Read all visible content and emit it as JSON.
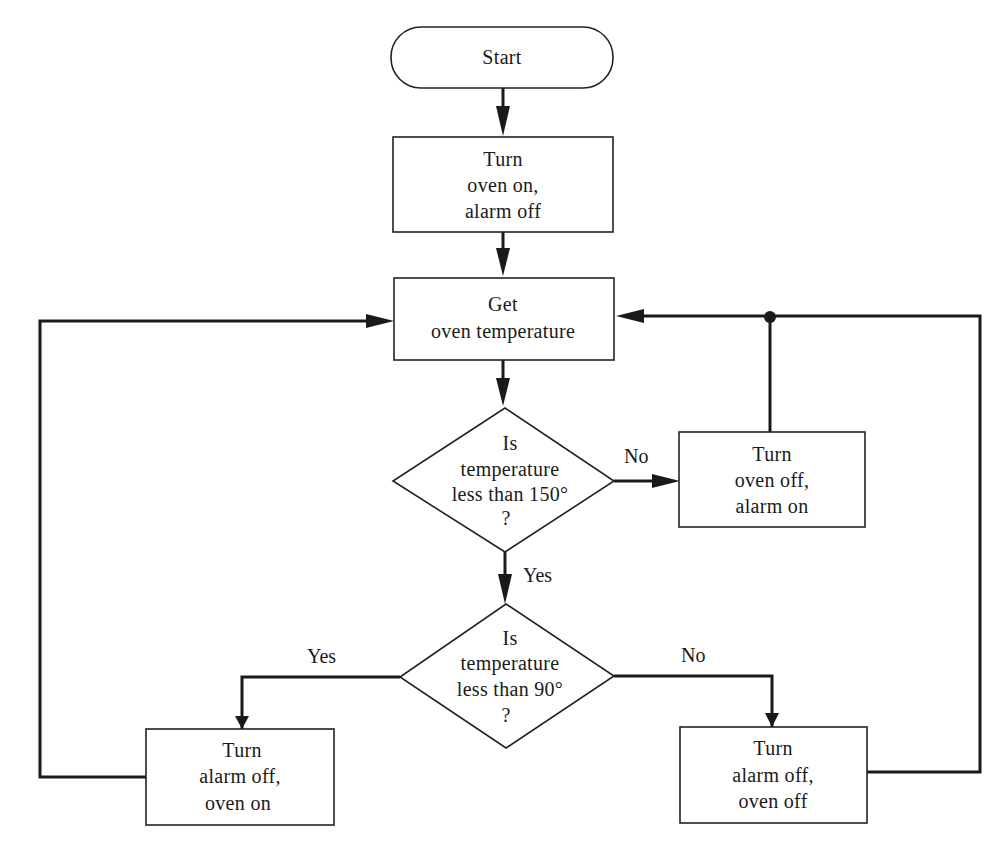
{
  "diagram": {
    "type": "flowchart",
    "nodes": {
      "start": {
        "kind": "terminator",
        "lines": [
          "Start"
        ]
      },
      "init": {
        "kind": "process",
        "lines": [
          "Turn",
          "oven on,",
          "alarm off"
        ]
      },
      "get_temp": {
        "kind": "process",
        "lines": [
          "Get",
          "oven temperature"
        ]
      },
      "check150": {
        "kind": "decision",
        "lines": [
          "Is",
          "temperature",
          "less than 150°",
          "?"
        ]
      },
      "overheat": {
        "kind": "process",
        "lines": [
          "Turn",
          "oven off,",
          "alarm on"
        ]
      },
      "check90": {
        "kind": "decision",
        "lines": [
          "Is",
          "temperature",
          "less than 90°",
          "?"
        ]
      },
      "heat": {
        "kind": "process",
        "lines": [
          "Turn",
          "alarm off,",
          "oven on"
        ]
      },
      "hold": {
        "kind": "process",
        "lines": [
          "Turn",
          "alarm off,",
          "oven off"
        ]
      }
    },
    "edge_labels": {
      "check150_no": "No",
      "check150_yes": "Yes",
      "check90_yes": "Yes",
      "check90_no": "No"
    },
    "edges": [
      {
        "from": "start",
        "to": "init",
        "label": ""
      },
      {
        "from": "init",
        "to": "get_temp",
        "label": ""
      },
      {
        "from": "get_temp",
        "to": "check150",
        "label": ""
      },
      {
        "from": "check150",
        "to": "overheat",
        "label": "No"
      },
      {
        "from": "check150",
        "to": "check90",
        "label": "Yes"
      },
      {
        "from": "overheat",
        "to": "get_temp",
        "label": ""
      },
      {
        "from": "check90",
        "to": "heat",
        "label": "Yes"
      },
      {
        "from": "check90",
        "to": "hold",
        "label": "No"
      },
      {
        "from": "heat",
        "to": "get_temp",
        "label": ""
      },
      {
        "from": "hold",
        "to": "get_temp",
        "label": ""
      }
    ]
  }
}
